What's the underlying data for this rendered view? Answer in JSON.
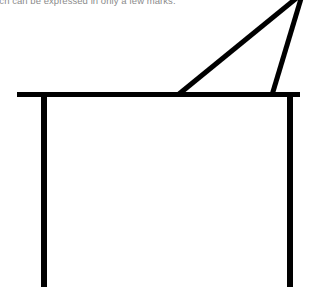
{
  "page": {
    "width": 310,
    "height": 294,
    "background_color": "#ffffff"
  },
  "caption": {
    "text": "uch can be expressed in only a few marks.",
    "color": "#8b8b8b",
    "clipped": "top-and-left"
  },
  "drawing": {
    "title": "line-drawing-table-with-triangle",
    "stroke_color": "#000000",
    "strokes": [
      {
        "name": "tabletop-horizontal-line",
        "kind": "line",
        "x1": 17,
        "y1": 94.5,
        "x2": 300,
        "y2": 94.5,
        "width": 5
      },
      {
        "name": "left-table-leg",
        "kind": "line",
        "x1": 44,
        "y1": 94,
        "x2": 44,
        "y2": 287,
        "width": 6
      },
      {
        "name": "right-table-leg",
        "kind": "line",
        "x1": 290,
        "y1": 94,
        "x2": 290,
        "y2": 287,
        "width": 6
      },
      {
        "name": "triangle-hypotenuse",
        "kind": "line",
        "x1": 179,
        "y1": 94,
        "x2": 304,
        "y2": -8,
        "width": 5
      },
      {
        "name": "triangle-short-side",
        "kind": "line",
        "x1": 272,
        "y1": 95,
        "x2": 303,
        "y2": -8,
        "width": 5
      }
    ]
  }
}
